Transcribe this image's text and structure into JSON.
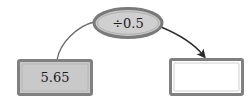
{
  "diagram": {
    "type": "function-machine-flow",
    "background_color": "#ffffff",
    "input_box": {
      "label": "5.65",
      "fill_color": "#c9c9c9",
      "border_color": "#808080",
      "x": 18,
      "y": 60,
      "width": 74,
      "height": 35
    },
    "operation_node": {
      "label": "÷0.5",
      "operator_symbol": "÷",
      "operand": "0.5",
      "shape": "ellipse",
      "fill_color": "#c9c9c9",
      "border_color": "#7a7a7a",
      "cx": 128,
      "cy": 23,
      "rx": 35,
      "ry": 15
    },
    "output_box": {
      "label": "",
      "fill_color": "#ffffff",
      "border_color": "#808080",
      "x": 170,
      "y": 59,
      "width": 73,
      "height": 36
    },
    "connectors": [
      {
        "name": "input-to-operation",
        "from": "input_box",
        "to": "operation_node",
        "arrowhead": false,
        "color": "#6b6b6b"
      },
      {
        "name": "operation-to-output",
        "from": "operation_node",
        "to": "output_box",
        "arrowhead": true,
        "color": "#2b2b2b"
      }
    ]
  }
}
